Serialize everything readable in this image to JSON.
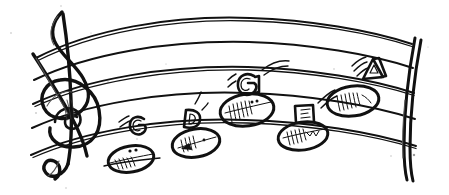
{
  "artwork": {
    "title": "Hand-drawn music staff with labeled notes",
    "background_color": "#ffffff",
    "ink_color": "#111111",
    "width": 449,
    "height": 195
  },
  "staff": {
    "clef": "treble-clef",
    "line_count": 5,
    "barline": "double-barline-right",
    "style": "hand-drawn-curved"
  },
  "notes": [
    {
      "label": "",
      "letter": "",
      "name": "note-head-1",
      "x": 131,
      "y": 158,
      "shaded": true,
      "ledger": true
    },
    {
      "label": "G",
      "letter": "G",
      "name": "note-label-g-low",
      "x": 139,
      "y": 126
    },
    {
      "label": "",
      "letter": "",
      "name": "note-head-2",
      "x": 196,
      "y": 143,
      "shaded": true,
      "ledger": false
    },
    {
      "label": "D",
      "letter": "D",
      "name": "note-label-d",
      "x": 190,
      "y": 119
    },
    {
      "label": "",
      "letter": "",
      "name": "note-head-3",
      "x": 247,
      "y": 110,
      "shaded": true,
      "ledger": false
    },
    {
      "label": "G",
      "letter": "G",
      "name": "note-label-g-high",
      "x": 245,
      "y": 85
    },
    {
      "label": "",
      "letter": "",
      "name": "note-head-4",
      "x": 303,
      "y": 136,
      "shaded": true,
      "ledger": false
    },
    {
      "label": "E",
      "letter": "E",
      "name": "note-label-e",
      "x": 303,
      "y": 115
    },
    {
      "label": "",
      "letter": "",
      "name": "note-head-5",
      "x": 353,
      "y": 100,
      "shaded": true,
      "ledger": false
    },
    {
      "label": "A",
      "letter": "A",
      "name": "note-label-a",
      "x": 372,
      "y": 68
    }
  ],
  "sequence": [
    "G",
    "D",
    "G",
    "E",
    "A"
  ],
  "labels": {
    "g_low": "G",
    "d": "D",
    "g_high": "G",
    "e": "E",
    "a": "A"
  }
}
